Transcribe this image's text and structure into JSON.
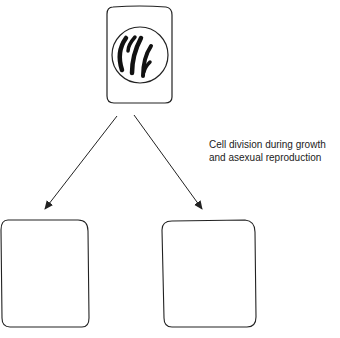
{
  "caption": {
    "line1": "Cell division during growth",
    "line2": "and asexual reproduction"
  },
  "diagram": {
    "parent_cell": "dividing cell with chromosomes",
    "daughter_cells": 2,
    "stroke_color": "#222222"
  }
}
